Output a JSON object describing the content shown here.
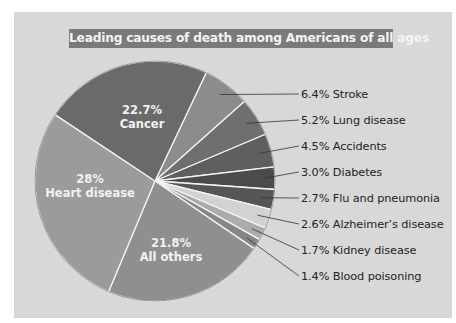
{
  "title": "Leading causes of death among Americans of all ages",
  "colors": {
    "background": "#d8d8d8",
    "title_bar": "#7a7a7a",
    "separator": "#f4f4f4"
  },
  "slices": [
    {
      "name": "Stroke",
      "pct_label": "6.4%",
      "value": 6.4,
      "color": "#8c8c8c",
      "label": "6.4% Stroke"
    },
    {
      "name": "Lung disease",
      "pct_label": "5.2%",
      "value": 5.2,
      "color": "#6f6f6f",
      "label": "5.2% Lung disease"
    },
    {
      "name": "Accidents",
      "pct_label": "4.5%",
      "value": 4.5,
      "color": "#5f5f5f",
      "label": "4.5% Accidents"
    },
    {
      "name": "Diabetes",
      "pct_label": "3.0%",
      "value": 3.0,
      "color": "#4b4b4b",
      "label": "3.0% Diabetes"
    },
    {
      "name": "Flu and pneumonia",
      "pct_label": "2.7%",
      "value": 2.7,
      "color": "#565656",
      "label": "2.7% Flu and pneumonia"
    },
    {
      "name": "Alzheimer's disease",
      "pct_label": "2.6%",
      "value": 2.6,
      "color": "#d2d2d2",
      "label": "2.6% Alzheimer's disease"
    },
    {
      "name": "Kidney disease",
      "pct_label": "1.7%",
      "value": 1.7,
      "color": "#ababab",
      "label": "1.7% Kidney disease"
    },
    {
      "name": "Blood poisoning",
      "pct_label": "1.4%",
      "value": 1.4,
      "color": "#868686",
      "label": "1.4% Blood poisoning"
    },
    {
      "name": "All others",
      "pct_label": "21.8%",
      "value": 21.8,
      "color": "#8f8f8f",
      "label": "21.8% All others"
    },
    {
      "name": "Heart disease",
      "pct_label": "28%",
      "value": 28,
      "color": "#9b9b9b",
      "label": "28% Heart disease"
    },
    {
      "name": "Cancer",
      "pct_label": "22.7%",
      "value": 22.7,
      "color": "#6a6a6a",
      "label": "22.7% Cancer"
    }
  ],
  "inner_labels": {
    "cancer": {
      "pct": "22.7%",
      "name": "Cancer"
    },
    "heart": {
      "pct": "28%",
      "name": "Heart disease"
    },
    "others": {
      "pct": "21.8%",
      "name": "All others"
    }
  },
  "outer_labels": [
    "6.4% Stroke",
    "5.2% Lung disease",
    "4.5% Accidents",
    "3.0% Diabetes",
    "2.7% Flu and pneumonia",
    "2.6% Alzheimer’s disease",
    "1.7% Kidney disease",
    "1.4% Blood poisoning"
  ],
  "chart_data": {
    "type": "pie",
    "title": "Leading causes of death among Americans of all ages",
    "categories": [
      "Heart disease",
      "Cancer",
      "All others",
      "Stroke",
      "Lung disease",
      "Accidents",
      "Diabetes",
      "Flu and pneumonia",
      "Alzheimer's disease",
      "Kidney disease",
      "Blood poisoning"
    ],
    "values": [
      28,
      22.7,
      21.8,
      6.4,
      5.2,
      4.5,
      3.0,
      2.7,
      2.6,
      1.7,
      1.4
    ],
    "unit": "%",
    "legend": "none (direct labels; small slices labeled with leader lines at right)"
  }
}
